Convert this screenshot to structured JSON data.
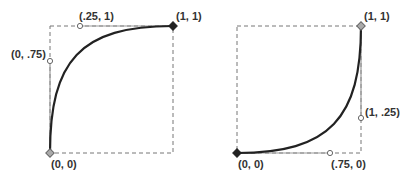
{
  "diagrams": [
    {
      "name": "ease-out-curve",
      "box": {
        "x0": 50,
        "y0": 26,
        "x1": 173,
        "y1": 153
      },
      "start": {
        "label": "(0, 0)",
        "value": [
          0,
          0
        ]
      },
      "end": {
        "label": "(1, 1)",
        "value": [
          1,
          1
        ]
      },
      "control1": {
        "label": "(0, .75)",
        "value": [
          0,
          0.75
        ]
      },
      "control2": {
        "label": "(.25, 1)",
        "value": [
          0.25,
          1
        ]
      }
    },
    {
      "name": "ease-in-curve",
      "box": {
        "x0": 237,
        "y0": 26,
        "x1": 361,
        "y1": 153
      },
      "start": {
        "label": "(0, 0)",
        "value": [
          0,
          0
        ]
      },
      "end": {
        "label": "(1, 1)",
        "value": [
          1,
          1
        ]
      },
      "control1": {
        "label": "(.75, 0)",
        "value": [
          0.75,
          0
        ]
      },
      "control2": {
        "label": "(1, .25)",
        "value": [
          1,
          0.25
        ]
      }
    }
  ],
  "colors": {
    "curve": "#222222",
    "box": "#777777",
    "handle": "#999999",
    "point": "#333333"
  }
}
